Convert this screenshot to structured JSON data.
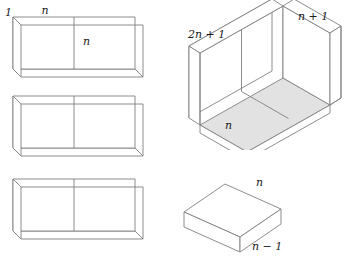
{
  "figure": {
    "background_color": "#ffffff",
    "line_color": "#808080",
    "label_color": "#1a1a1a",
    "shade_color": "#e2e2e2"
  },
  "slabs": {
    "count": 3,
    "description": "three identical flat slabs, each split into two equal squares by a vertical divider",
    "labels": {
      "thickness": "1",
      "top_edge": "n",
      "divider": "n"
    },
    "items": [
      {
        "name": "slab-top",
        "labelled": true
      },
      {
        "name": "slab-middle",
        "labelled": false
      },
      {
        "name": "slab-bottom",
        "labelled": false
      }
    ]
  },
  "open_box": {
    "name": "open-box",
    "labels": {
      "left_wall": "2n + 1",
      "right_wall": "n + 1",
      "floor": "n"
    },
    "floor_shaded": true
  },
  "brick": {
    "name": "small-brick",
    "labels": {
      "top_edge": "n",
      "front_edge": "n − 1"
    }
  }
}
